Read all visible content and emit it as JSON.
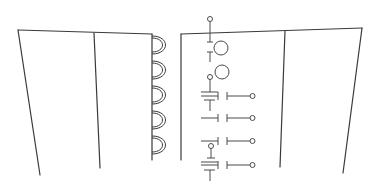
{
  "diagram": {
    "type": "line-art technical drawing",
    "stroke_color": "#3a3a3a",
    "background": "#ffffff",
    "left_panel": {
      "outline": [
        [
          18,
          30
        ],
        [
          152,
          34
        ],
        [
          152,
          160
        ],
        [
          40,
          175
        ]
      ],
      "divider": [
        [
          94,
          33
        ],
        [
          100,
          168
        ]
      ],
      "hinge_loops": [
        {
          "cy": 45
        },
        {
          "cy": 70
        },
        {
          "cy": 95
        },
        {
          "cy": 120
        },
        {
          "cy": 145
        }
      ]
    },
    "right_panel": {
      "left_edge": [
        [
          181,
          34
        ],
        [
          181,
          160
        ]
      ],
      "top_edge": [
        [
          181,
          34
        ],
        [
          362,
          28
        ]
      ],
      "divider": [
        [
          285,
          31
        ],
        [
          280,
          167
        ]
      ],
      "right_edge": [
        [
          362,
          28
        ],
        [
          343,
          173
        ]
      ]
    },
    "symbols": {
      "top_pin": {
        "x": 210,
        "y_top": 18,
        "y_bottom": 45
      },
      "circles": [
        {
          "cx": 221,
          "cy": 50,
          "r": 7
        },
        {
          "cx": 222,
          "cy": 72,
          "r": 7
        }
      ],
      "switch_rows": [
        {
          "y": 96,
          "ground_above": true,
          "ground_below": true
        },
        {
          "y": 118,
          "ground_above": false,
          "ground_below": false
        },
        {
          "y": 141,
          "ground_above": false,
          "ground_below": false
        },
        {
          "y": 165,
          "ground_above": true,
          "ground_below": true
        }
      ]
    }
  }
}
